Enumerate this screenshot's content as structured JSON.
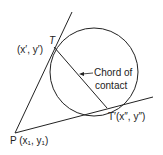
{
  "diagram": {
    "labels": {
      "point_T": "T",
      "point_T_coords": "(x′, y′)",
      "point_T_prime": "T′(x″, y″)",
      "point_P": "P (x₁, y₁)",
      "chord_label_line1": "Chord of",
      "chord_label_line2": "contact"
    },
    "colors": {
      "stroke": "#222222",
      "background": "#ffffff"
    },
    "shapes": {
      "circle": {
        "cx": 94,
        "cy": 72,
        "r": 44
      },
      "point_P": {
        "x": 15,
        "y": 133
      },
      "point_T": {
        "x": 54,
        "y": 47
      },
      "point_T_prime": {
        "x": 107,
        "y": 108
      }
    }
  }
}
